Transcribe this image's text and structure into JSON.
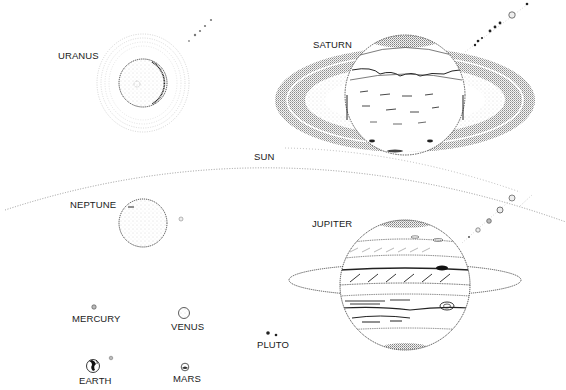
{
  "diagram": {
    "title": "",
    "style": "stippled pen illustration of the planets of the solar system",
    "colors": {
      "ink": "#1a1a1a",
      "stipple": "#555555",
      "background": "#ffffff"
    },
    "labels": {
      "uranus": "URANUS",
      "saturn": "SATURN",
      "sun": "SUN",
      "neptune": "NEPTUNE",
      "jupiter": "JUPITER",
      "mercury": "MERCURY",
      "venus": "VENUS",
      "pluto": "PLUTO",
      "earth": "EARTH",
      "mars": "MARS"
    },
    "bodies": [
      {
        "name": "Uranus",
        "center": [
          143,
          83
        ],
        "radius": 24,
        "rings": true,
        "moons": 5
      },
      {
        "name": "Saturn",
        "center": [
          405,
          100
        ],
        "radius": 60,
        "rings": true,
        "moons": 9
      },
      {
        "name": "Sun",
        "arc": "limb arc across the middle of the illustration"
      },
      {
        "name": "Neptune",
        "center": [
          143,
          223
        ],
        "radius": 23,
        "moons": 1
      },
      {
        "name": "Jupiter",
        "center": [
          405,
          285
        ],
        "radius": 65,
        "rings": true,
        "moons": 5
      },
      {
        "name": "Mercury",
        "center": [
          94,
          306
        ],
        "radius": 2
      },
      {
        "name": "Venus",
        "center": [
          184,
          313
        ],
        "radius": 6
      },
      {
        "name": "Earth",
        "center": [
          93,
          365
        ],
        "radius": 7,
        "moons": 1
      },
      {
        "name": "Mars",
        "center": [
          185,
          367
        ],
        "radius": 4
      },
      {
        "name": "Pluto",
        "center": [
          268,
          333
        ],
        "radius": 2,
        "moons": 1
      }
    ]
  }
}
